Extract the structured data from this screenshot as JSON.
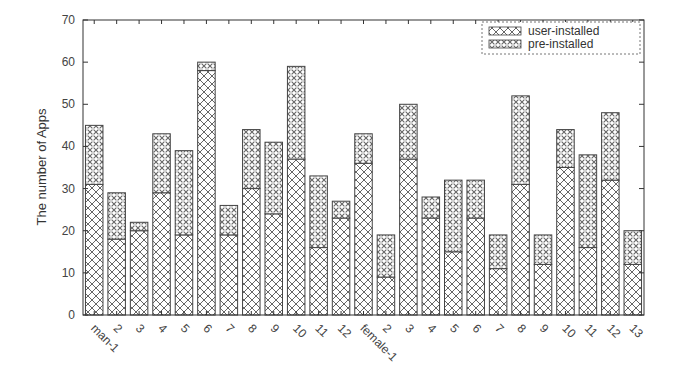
{
  "chart_data": {
    "type": "bar",
    "stacked": true,
    "title": "",
    "xlabel": "",
    "ylabel": "The number of Apps",
    "ylim": [
      0,
      70
    ],
    "yticks": [
      0,
      10,
      20,
      30,
      40,
      50,
      60,
      70
    ],
    "grid": false,
    "legend_position": "top-right",
    "categories": [
      "man-1",
      "2",
      "3",
      "4",
      "5",
      "6",
      "7",
      "8",
      "9",
      "10",
      "11",
      "12",
      "female-1",
      "2",
      "3",
      "4",
      "5",
      "6",
      "7",
      "8",
      "9",
      "10",
      "11",
      "12",
      "13"
    ],
    "series": [
      {
        "name": "user-installed",
        "pattern": "crosshatch",
        "values": [
          31,
          18,
          20,
          29,
          19,
          58,
          19,
          30,
          24,
          37,
          16,
          23,
          36,
          9,
          37,
          23,
          15,
          23,
          11,
          31,
          12,
          35,
          16,
          32,
          12
        ]
      },
      {
        "name": "pre-installed",
        "pattern": "dotted-hatch",
        "values": [
          14,
          11,
          2,
          14,
          20,
          2,
          7,
          14,
          17,
          22,
          17,
          4,
          7,
          10,
          13,
          5,
          17,
          9,
          8,
          21,
          7,
          9,
          22,
          16,
          8
        ]
      }
    ],
    "totals": [
      45,
      29,
      22,
      43,
      39,
      60,
      26,
      44,
      41,
      59,
      33,
      27,
      43,
      19,
      50,
      28,
      32,
      32,
      19,
      52,
      19,
      44,
      38,
      48,
      20
    ]
  },
  "legend": {
    "items": [
      "user-installed",
      "pre-installed"
    ]
  },
  "axis": {
    "ylabel": "The number of Apps"
  }
}
